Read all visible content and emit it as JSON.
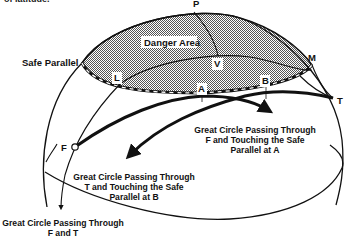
{
  "figure": {
    "clipped_top_text": "of latitude.",
    "region_label": "Danger Area",
    "safe_parallel_label": "Safe Parallel",
    "points": {
      "P": "P",
      "V": "V",
      "M": "M",
      "L": "L",
      "A": "A",
      "B": "B",
      "T": "T",
      "F": "F"
    },
    "captions": {
      "gc_f_a": [
        "Great Circle Passing Through",
        "F and Touching the Safe",
        "Parallel at A"
      ],
      "gc_t_b": [
        "Great Circle Passing Through",
        "T and Touching the Safe",
        "Parallel at B"
      ],
      "gc_f_t": [
        "Great Circle Passing Through",
        "F and T"
      ]
    },
    "colors": {
      "line": "#111111",
      "danger_fill": "#a9a9a9",
      "background": "#ffffff"
    }
  }
}
